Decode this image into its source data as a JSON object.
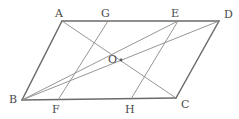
{
  "figure": {
    "width": 239,
    "height": 119,
    "background_color": "#ffffff",
    "outline_color": "#6b6b6b",
    "inner_line_color": "#8a8a8a",
    "label_color": "#4a4a4a"
  },
  "points": {
    "A": {
      "label": "A",
      "x": 62,
      "y": 21,
      "label_x": 55,
      "label_y": 8,
      "role": "vertex"
    },
    "B": {
      "label": "B",
      "x": 22,
      "y": 100,
      "label_x": 9,
      "label_y": 94,
      "role": "vertex"
    },
    "C": {
      "label": "C",
      "x": 176,
      "y": 98,
      "label_x": 181,
      "label_y": 99,
      "role": "vertex"
    },
    "D": {
      "label": "D",
      "x": 219,
      "y": 21,
      "label_x": 224,
      "label_y": 9,
      "role": "vertex"
    },
    "O": {
      "label": "O",
      "x": 121,
      "y": 60,
      "label_x": 108,
      "label_y": 54,
      "role": "center"
    },
    "G": {
      "label": "G",
      "x": 108,
      "y": 21,
      "label_x": 101,
      "label_y": 8,
      "role": "point-on-AD"
    },
    "E": {
      "label": "E",
      "x": 178,
      "y": 21,
      "label_x": 171,
      "label_y": 8,
      "role": "point-on-AD"
    },
    "F": {
      "label": "F",
      "x": 58,
      "y": 100,
      "label_x": 52,
      "label_y": 104,
      "role": "point-on-BC"
    },
    "H": {
      "label": "H",
      "x": 131,
      "y": 99,
      "label_x": 125,
      "label_y": 104,
      "role": "point-on-BC"
    }
  },
  "outline_edges": [
    {
      "name": "edge-AD",
      "from": "A",
      "to": "D"
    },
    {
      "name": "edge-DC",
      "from": "D",
      "to": "C"
    },
    {
      "name": "edge-CB",
      "from": "C",
      "to": "B"
    },
    {
      "name": "edge-BA",
      "from": "B",
      "to": "A"
    }
  ],
  "inner_lines": [
    {
      "name": "diagonal-AC",
      "from": "A",
      "to": "C"
    },
    {
      "name": "diagonal-BD",
      "from": "B",
      "to": "D"
    },
    {
      "name": "segment-GF",
      "from": "G",
      "to": "F"
    },
    {
      "name": "segment-EH",
      "from": "E",
      "to": "H"
    },
    {
      "name": "segment-BE",
      "from": "B",
      "to": "E"
    }
  ]
}
